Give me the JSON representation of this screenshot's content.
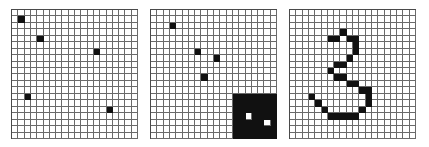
{
  "grid": {
    "rows": 20,
    "cols": 20,
    "on_color": "#111111",
    "off_color": "#ffffff",
    "line_color": "#6a6a6a"
  },
  "panels": [
    {
      "id": "panel-1",
      "description": "scattered isolated cells",
      "filled_cells": [
        [
          1,
          1
        ],
        [
          4,
          4
        ],
        [
          6,
          13
        ],
        [
          13,
          2
        ],
        [
          15,
          15
        ]
      ]
    },
    {
      "id": "panel-2",
      "description": "isolated cells plus large block with two holes",
      "filled_cells": [
        [
          2,
          3
        ],
        [
          6,
          7
        ],
        [
          7,
          10
        ],
        [
          10,
          8
        ]
      ],
      "filled_blocks": [
        {
          "row_start": 13,
          "row_end": 19,
          "col_start": 13,
          "col_end": 19
        }
      ],
      "holes": [
        [
          16,
          15
        ],
        [
          17,
          18
        ]
      ]
    },
    {
      "id": "panel-3",
      "description": "digit 3 drawn in cells",
      "filled_cells": [
        [
          3,
          8
        ],
        [
          4,
          6
        ],
        [
          4,
          7
        ],
        [
          4,
          9
        ],
        [
          4,
          10
        ],
        [
          5,
          10
        ],
        [
          6,
          10
        ],
        [
          7,
          9
        ],
        [
          8,
          7
        ],
        [
          8,
          8
        ],
        [
          9,
          6
        ],
        [
          10,
          7
        ],
        [
          10,
          8
        ],
        [
          11,
          9
        ],
        [
          11,
          10
        ],
        [
          12,
          11
        ],
        [
          12,
          12
        ],
        [
          13,
          3
        ],
        [
          13,
          12
        ],
        [
          14,
          4
        ],
        [
          14,
          12
        ],
        [
          15,
          5
        ],
        [
          15,
          11
        ],
        [
          16,
          6
        ],
        [
          16,
          7
        ],
        [
          16,
          8
        ],
        [
          16,
          9
        ],
        [
          16,
          10
        ]
      ]
    }
  ]
}
